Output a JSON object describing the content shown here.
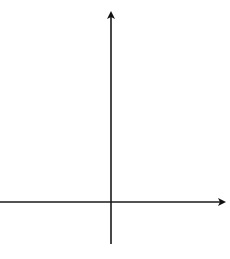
{
  "chart_data": {
    "type": "line",
    "title": "",
    "xlabel": "x",
    "ylabel": "y",
    "function": "y = (1/2)^x",
    "x_tick_label": {
      "value": 1,
      "text": "1"
    },
    "y_tick_label": {
      "value": 2,
      "text": "2"
    },
    "x_grid_unit": 1,
    "y_grid_unit": 2,
    "xlim": [
      -5,
      5
    ],
    "ylim": [
      -2,
      18
    ],
    "grid": true,
    "legend": null,
    "series": [
      {
        "name": "curve",
        "arrows": "both ends",
        "x": [
          -4.25,
          -4,
          -3,
          -2,
          -1,
          0,
          1,
          1.5
        ],
        "y": [
          19.0,
          16,
          8,
          4,
          2,
          1,
          0.5,
          0.35
        ]
      }
    ]
  },
  "labels": {
    "x_axis": "x",
    "y_axis": "y",
    "x_tick": "1",
    "y_tick": "2"
  }
}
